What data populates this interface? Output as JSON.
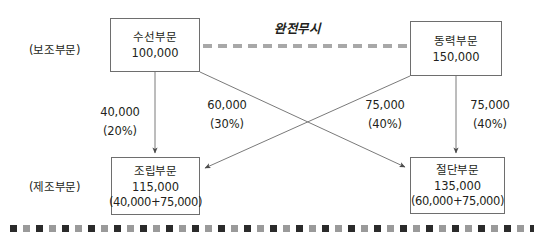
{
  "diagram": {
    "title_note": "완전무시",
    "side_labels": {
      "support": "(보조부문)",
      "manufacturing": "(제조부문)"
    },
    "boxes": {
      "repair": {
        "name": "수선부문",
        "amount": "100,000",
        "detail": ""
      },
      "power": {
        "name": "동력부문",
        "amount": "150,000",
        "detail": ""
      },
      "assembly": {
        "name": "조립부문",
        "amount": "115,000",
        "detail": "(40,000+75,000)"
      },
      "cutting": {
        "name": "절단부문",
        "amount": "135,000",
        "detail": "(60,000+75,000)"
      }
    },
    "flows": {
      "repair_to_assembly": {
        "amount": "40,000",
        "percent": "(20%)"
      },
      "repair_to_cutting": {
        "amount": "60,000",
        "percent": "(30%)"
      },
      "power_to_assembly": {
        "amount": "75,000",
        "percent": "(40%)"
      },
      "power_to_cutting": {
        "amount": "75,000",
        "percent": "(40%)"
      }
    },
    "colors": {
      "box_border": "#6e6e6e",
      "arrow": "#5a5a5a",
      "divider_dashed": "#a8a8a8",
      "bottom_dotted_dark": "#2b2b2b",
      "bottom_dotted_light": "#9a9a9a",
      "text": "#231f20"
    }
  }
}
